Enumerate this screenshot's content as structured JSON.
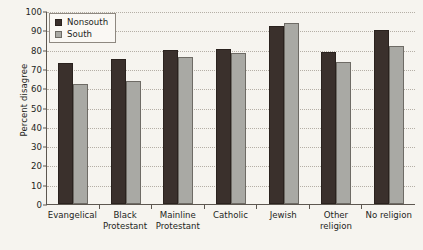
{
  "chart_data": {
    "type": "bar",
    "title": "",
    "xlabel": "",
    "ylabel": "Percent disagree",
    "ylim": [
      0,
      100
    ],
    "ytick_step": 10,
    "yticks": [
      0,
      10,
      20,
      30,
      40,
      50,
      60,
      70,
      80,
      90,
      100
    ],
    "grid": true,
    "legend_position": "top-left",
    "categories": [
      "Evangelical",
      "Black Protestant",
      "Mainline Protestant",
      "Catholic",
      "Jewish",
      "Other religion",
      "No religion"
    ],
    "category_lines": [
      [
        "Evangelical"
      ],
      [
        "Black",
        "Protestant"
      ],
      [
        "Mainline",
        "Protestant"
      ],
      [
        "Catholic"
      ],
      [
        "Jewish"
      ],
      [
        "Other",
        "religion"
      ],
      [
        "No religion"
      ]
    ],
    "series": [
      {
        "name": "Nonsouth",
        "color": "#3a302c",
        "values": [
          73,
          75,
          80,
          80.5,
          92,
          79,
          90
        ]
      },
      {
        "name": "South",
        "color": "#a9a9a4",
        "values": [
          62,
          63.5,
          76,
          78,
          94,
          73.5,
          82
        ]
      }
    ]
  },
  "legend": {
    "items": [
      {
        "label": "Nonsouth",
        "swatch": "nonsouth"
      },
      {
        "label": "South",
        "swatch": "south"
      }
    ]
  },
  "colors": {
    "background": "#f6f4ef",
    "axis": "#5d5750",
    "grid": "#b5afa6",
    "text": "#241f1c",
    "nonsouth": "#3a302c",
    "south": "#a9a9a4"
  }
}
